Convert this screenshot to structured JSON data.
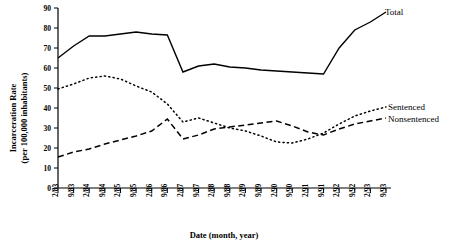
{
  "chart_data": {
    "type": "line",
    "title": "",
    "xlabel": "Date (month, year)",
    "ylabel": "Incarceration Rate\n(per 100,000 inhabitants)",
    "ylabel_line1": "Incarceration Rate",
    "ylabel_line2": "(per 100,000 inhabitants)",
    "ylim": [
      0,
      90
    ],
    "yticks": [
      0,
      10,
      20,
      30,
      40,
      50,
      60,
      70,
      80,
      90
    ],
    "grid": false,
    "legend_position": "right-inline",
    "categories": [
      "2/83",
      "9/83",
      "2/84",
      "9/84",
      "2/85",
      "9/85",
      "2/86",
      "9/86",
      "2/87",
      "9/87",
      "2/88",
      "9/88",
      "2/89",
      "9/89",
      "2/90",
      "9/90",
      "2/91",
      "9/91",
      "2/92",
      "9/92",
      "2/93",
      "9/93"
    ],
    "series": [
      {
        "name": "Total",
        "style": "solid",
        "values": [
          65,
          71,
          76,
          76,
          77,
          78,
          77,
          76.5,
          58,
          61,
          62,
          60.5,
          60,
          59,
          58.5,
          58,
          57.5,
          57,
          70,
          79,
          83,
          88
        ]
      },
      {
        "name": "Sentenced",
        "style": "dotted",
        "values": [
          49.5,
          52,
          55,
          56,
          54.5,
          51,
          48,
          42,
          33,
          35,
          32.5,
          30,
          28.5,
          26,
          23,
          22.5,
          24.5,
          27.5,
          32,
          36,
          38.5,
          40.5
        ]
      },
      {
        "name": "Nonsentenced",
        "style": "dashed",
        "values": [
          15.5,
          18,
          19.5,
          22,
          24,
          26,
          28.5,
          34.5,
          24.5,
          26.5,
          29.5,
          30.5,
          31.5,
          32.5,
          33.5,
          31,
          28,
          26.5,
          29.5,
          32,
          33.5,
          35
        ]
      }
    ]
  },
  "legend": {
    "total": "Total",
    "sentenced": "Sentenced",
    "nonsentenced": "Nonsentenced"
  }
}
